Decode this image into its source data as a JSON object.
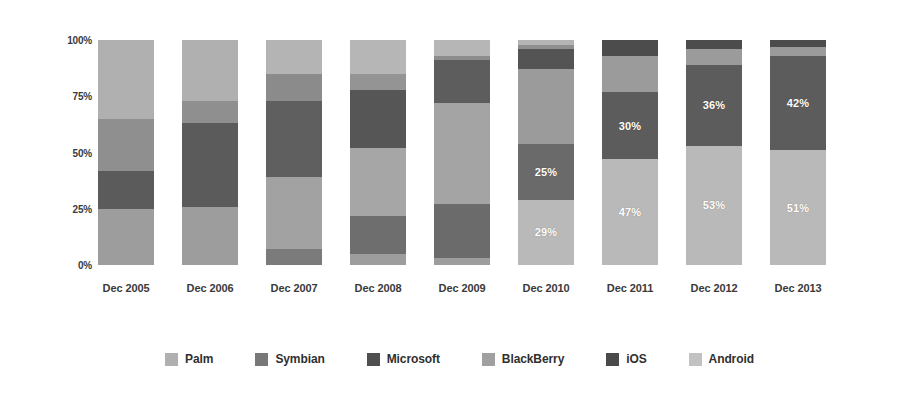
{
  "chart_data": {
    "type": "bar",
    "title": "",
    "subtitle": "",
    "xlabel": "",
    "ylabel": "",
    "stacked": true,
    "stack_mode": "percent",
    "grid": false,
    "legend_position": "bottom",
    "ylim": [
      0,
      100
    ],
    "yticks": [
      "0%",
      "25%",
      "50%",
      "75%",
      "100%"
    ],
    "ytick_values": [
      0,
      25,
      50,
      75,
      100
    ],
    "categories": [
      "Dec 2005",
      "Dec 2006",
      "Dec 2007",
      "Dec 2008",
      "Dec 2009",
      "Dec 2010",
      "Dec 2011",
      "Dec 2012",
      "Dec 2013"
    ],
    "stack_order_bottom_to_top": [
      "Palm",
      "Microsoft",
      "BlackBerry",
      "Symbian",
      "iOS",
      "Android"
    ],
    "series": [
      {
        "name": "Palm",
        "color": "#9d9d9d",
        "values": [
          25,
          26,
          7,
          5,
          3,
          0,
          0,
          0,
          0
        ]
      },
      {
        "name": "Microsoft",
        "color": "#5b5b5b",
        "values": [
          17,
          37,
          32,
          34,
          26,
          0,
          0,
          0,
          0
        ]
      },
      {
        "name": "BlackBerry",
        "color": "#8f8f8f",
        "values": [
          23,
          10,
          20,
          22,
          33,
          0,
          0,
          0,
          0
        ]
      },
      {
        "name": "Symbian",
        "color": "#6f6f6f",
        "values": [
          0,
          0,
          0,
          0,
          0,
          0,
          0,
          0,
          0
        ]
      },
      {
        "name": "iOS",
        "color": "#4a4a4a",
        "values": [
          0,
          0,
          0,
          0,
          0,
          25,
          30,
          36,
          42
        ]
      },
      {
        "name": "Android",
        "color": "#b9b9b9",
        "values": [
          35,
          27,
          41,
          39,
          38,
          29,
          47,
          53,
          51
        ]
      }
    ],
    "bars": [
      {
        "category": "Dec 2005",
        "segments": [
          {
            "name": "Palm",
            "value": 25,
            "color": "#9d9d9d",
            "label": ""
          },
          {
            "name": "Microsoft",
            "value": 17,
            "color": "#5b5b5b",
            "label": ""
          },
          {
            "name": "BlackBerry",
            "value": 23,
            "color": "#8f8f8f",
            "label": ""
          },
          {
            "name": "Symbian",
            "value": 35,
            "color": "#b0b0b0",
            "label": ""
          }
        ]
      },
      {
        "category": "Dec 2006",
        "segments": [
          {
            "name": "Palm",
            "value": 26,
            "color": "#9d9d9d",
            "label": ""
          },
          {
            "name": "Microsoft",
            "value": 37,
            "color": "#5b5b5b",
            "label": ""
          },
          {
            "name": "BlackBerry",
            "value": 10,
            "color": "#8f8f8f",
            "label": ""
          },
          {
            "name": "Symbian",
            "value": 27,
            "color": "#b0b0b0",
            "label": ""
          }
        ]
      },
      {
        "category": "Dec 2007",
        "segments": [
          {
            "name": "Palm",
            "value": 7,
            "color": "#7b7b7b",
            "label": ""
          },
          {
            "name": "Microsoft",
            "value": 32,
            "color": "#a2a2a2",
            "label": ""
          },
          {
            "name": "BlackBerry",
            "value": 34,
            "color": "#5f5f5f",
            "label": ""
          },
          {
            "name": "Symbian",
            "value": 12,
            "color": "#8b8b8b",
            "label": ""
          },
          {
            "name": "Android",
            "value": 15,
            "color": "#b4b4b4",
            "label": ""
          }
        ]
      },
      {
        "category": "Dec 2008",
        "segments": [
          {
            "name": "Palm",
            "value": 5,
            "color": "#9d9d9d",
            "label": ""
          },
          {
            "name": "Microsoft",
            "value": 17,
            "color": "#6e6e6e",
            "label": ""
          },
          {
            "name": "BlackBerry",
            "value": 30,
            "color": "#a6a6a6",
            "label": ""
          },
          {
            "name": "Symbian",
            "value": 26,
            "color": "#565656",
            "label": ""
          },
          {
            "name": "iOS",
            "value": 7,
            "color": "#949494",
            "label": ""
          },
          {
            "name": "Android",
            "value": 15,
            "color": "#b6b6b6",
            "label": ""
          }
        ]
      },
      {
        "category": "Dec 2009",
        "segments": [
          {
            "name": "Palm",
            "value": 3,
            "color": "#9d9d9d",
            "label": ""
          },
          {
            "name": "Microsoft",
            "value": 24,
            "color": "#6b6b6b",
            "label": ""
          },
          {
            "name": "BlackBerry",
            "value": 45,
            "color": "#a4a4a4",
            "label": ""
          },
          {
            "name": "Symbian",
            "value": 19,
            "color": "#5d5d5d",
            "label": ""
          },
          {
            "name": "iOS",
            "value": 2,
            "color": "#8d8d8d",
            "label": ""
          },
          {
            "name": "Android",
            "value": 7,
            "color": "#b6b6b6",
            "label": ""
          }
        ]
      },
      {
        "category": "Dec 2010",
        "segments": [
          {
            "name": "Android",
            "value": 29,
            "color": "#b9b9b9",
            "label": "29%"
          },
          {
            "name": "iOS",
            "value": 25,
            "color": "#6a6a6a",
            "label": "25%"
          },
          {
            "name": "BlackBerry",
            "value": 33,
            "color": "#9b9b9b",
            "label": ""
          },
          {
            "name": "Microsoft",
            "value": 9,
            "color": "#545454",
            "label": ""
          },
          {
            "name": "Symbian",
            "value": 2,
            "color": "#8f8f8f",
            "label": ""
          },
          {
            "name": "Palm",
            "value": 2,
            "color": "#b4b4b4",
            "label": ""
          }
        ]
      },
      {
        "category": "Dec 2011",
        "segments": [
          {
            "name": "Android",
            "value": 47,
            "color": "#b9b9b9",
            "label": "47%"
          },
          {
            "name": "iOS",
            "value": 30,
            "color": "#5c5c5c",
            "label": "30%"
          },
          {
            "name": "BlackBerry",
            "value": 16,
            "color": "#9b9b9b",
            "label": ""
          },
          {
            "name": "Microsoft",
            "value": 7,
            "color": "#4c4c4c",
            "label": ""
          }
        ]
      },
      {
        "category": "Dec 2012",
        "segments": [
          {
            "name": "Android",
            "value": 53,
            "color": "#b9b9b9",
            "label": "53%"
          },
          {
            "name": "iOS",
            "value": 36,
            "color": "#5c5c5c",
            "label": "36%"
          },
          {
            "name": "BlackBerry",
            "value": 7,
            "color": "#9b9b9b",
            "label": ""
          },
          {
            "name": "Microsoft",
            "value": 4,
            "color": "#4c4c4c",
            "label": ""
          }
        ]
      },
      {
        "category": "Dec 2013",
        "segments": [
          {
            "name": "Android",
            "value": 51,
            "color": "#b9b9b9",
            "label": "51%"
          },
          {
            "name": "iOS",
            "value": 42,
            "color": "#5c5c5c",
            "label": "42%"
          },
          {
            "name": "BlackBerry",
            "value": 4,
            "color": "#9b9b9b",
            "label": ""
          },
          {
            "name": "Microsoft",
            "value": 3,
            "color": "#4c4c4c",
            "label": ""
          }
        ]
      }
    ],
    "legend": [
      {
        "label": "Palm",
        "color": "#b0b0b0"
      },
      {
        "label": "Symbian",
        "color": "#787878"
      },
      {
        "label": "Microsoft",
        "color": "#4f4f4f"
      },
      {
        "label": "BlackBerry",
        "color": "#a0a0a0"
      },
      {
        "label": "iOS",
        "color": "#4a4a4a"
      },
      {
        "label": "Android",
        "color": "#c2c2c2"
      }
    ]
  }
}
